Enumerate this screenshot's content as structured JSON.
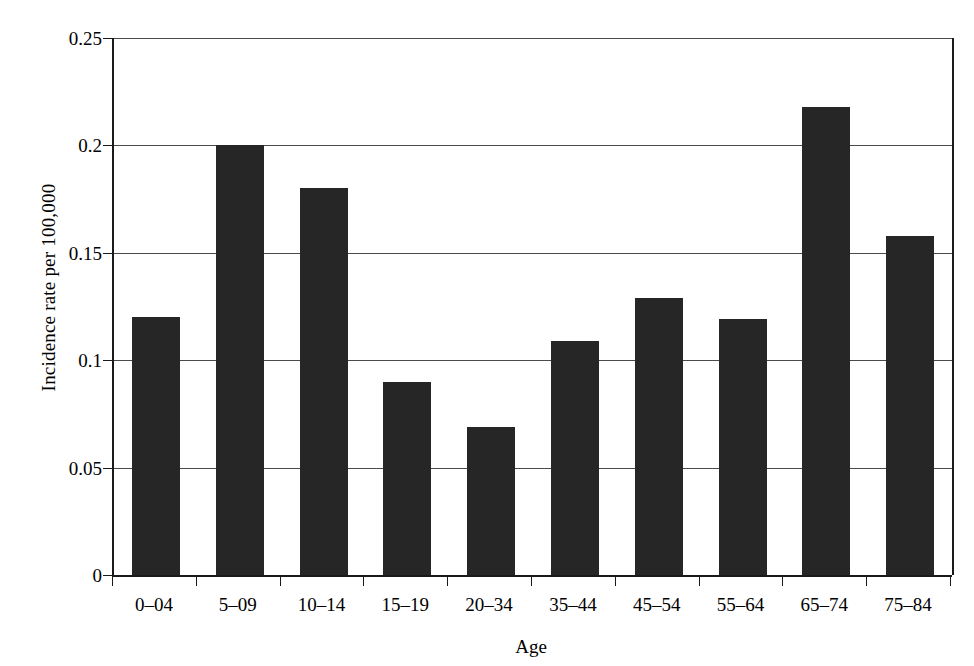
{
  "chart_data": {
    "type": "bar",
    "title": "",
    "xlabel": "Age",
    "ylabel": "Incidence rate per 100,000",
    "categories": [
      "0–04",
      "5–09",
      "10–14",
      "15–19",
      "20–34",
      "35–44",
      "45–54",
      "55–64",
      "65–74",
      "75–84"
    ],
    "values": [
      0.12,
      0.2,
      0.18,
      0.09,
      0.069,
      0.109,
      0.129,
      0.119,
      0.218,
      0.158
    ],
    "ylim": [
      0,
      0.25
    ],
    "xlim_note": "categorical",
    "yticks": [
      0,
      0.05,
      0.1,
      0.15,
      0.2,
      0.25
    ],
    "ytick_labels": [
      "0",
      "0.05",
      "0.1",
      "0.15",
      "0.2",
      "0.25"
    ],
    "grid": "horizontal",
    "legend": "none",
    "bar_color": "#262626",
    "axis_color": "#1a1a1a",
    "gridline_color": "#4a4a4a",
    "background": "#ffffff"
  }
}
